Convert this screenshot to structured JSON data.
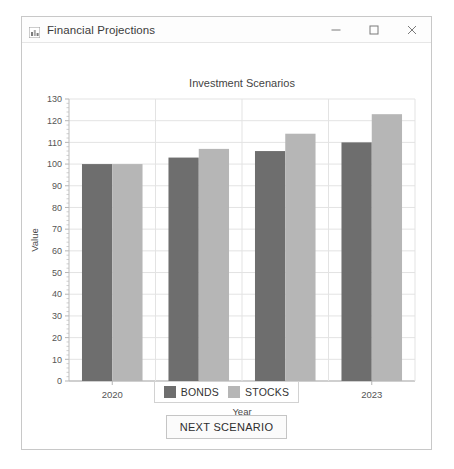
{
  "window": {
    "title": "Financial Projections",
    "icon": "bar-chart-icon",
    "controls": {
      "minimize": "minimize-icon",
      "maximize": "maximize-icon",
      "close": "close-icon"
    }
  },
  "legend": {
    "items": [
      {
        "label": "BONDS",
        "color": "#6e6e6e"
      },
      {
        "label": "STOCKS",
        "color": "#b6b6b6"
      }
    ]
  },
  "actions": {
    "next_scenario": "NEXT SCENARIO"
  },
  "chart_data": {
    "type": "bar",
    "title": "Investment Scenarios",
    "xlabel": "Year",
    "ylabel": "Value",
    "categories": [
      "2020",
      "2021",
      "2022",
      "2023"
    ],
    "series": [
      {
        "name": "BONDS",
        "color": "#6e6e6e",
        "values": [
          100,
          103,
          106,
          110
        ]
      },
      {
        "name": "STOCKS",
        "color": "#b6b6b6",
        "values": [
          100,
          107,
          114,
          123
        ]
      }
    ],
    "ylim": [
      0,
      130
    ],
    "yticks": [
      0,
      10,
      20,
      30,
      40,
      50,
      60,
      70,
      80,
      90,
      100,
      110,
      120,
      130
    ],
    "ytick_labels": [
      "0",
      "10",
      "20",
      "30",
      "40",
      "50",
      "60",
      "70",
      "80",
      "90",
      "100",
      "110",
      "120",
      "130"
    ],
    "grid": true,
    "grid_color": "#e3e3e3",
    "legend_position": "bottom",
    "background": "#ffffff"
  }
}
